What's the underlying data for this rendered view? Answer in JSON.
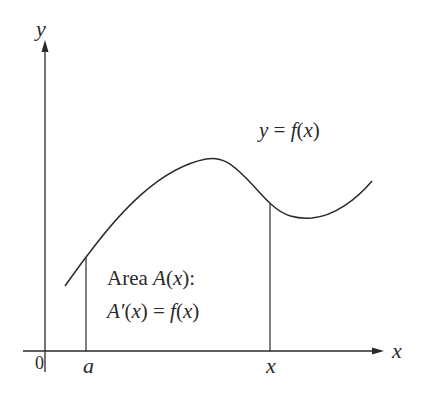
{
  "diagram": {
    "colors": {
      "background": "#ffffff",
      "stroke": "#2a2a2a"
    },
    "axes": {
      "y_label": "y",
      "x_label": "x",
      "origin_label": "0"
    },
    "ticks": {
      "a_label": "a",
      "x_label": "x"
    },
    "curve": {
      "label_lhs": "y",
      "label_eq": " = ",
      "label_rhs_f": "f",
      "label_rhs_open": "(",
      "label_rhs_var": "x",
      "label_rhs_close": ")"
    },
    "annotation": {
      "line1_word": "Area ",
      "line1_fn": "A",
      "line1_open": "(",
      "line1_var": "x",
      "line1_close": "):",
      "line2_fn": "A′",
      "line2_open": "(",
      "line2_var": "x",
      "line2_close": ")",
      "line2_eq": " = ",
      "line2_f": "f",
      "line2_open2": "(",
      "line2_var2": "x",
      "line2_close2": ")"
    }
  }
}
